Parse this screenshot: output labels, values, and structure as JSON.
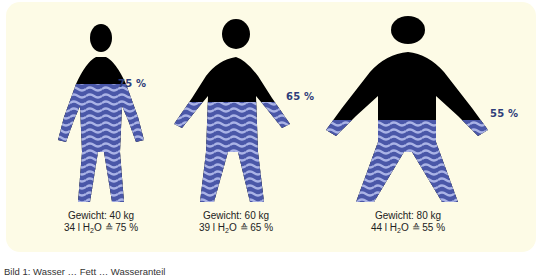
{
  "figures": [
    {
      "id": "person-40kg",
      "water_percent_label": "75 %",
      "weight_label": "Gewicht: 40 kg",
      "water_liters": "34 l",
      "water_equiv": "≙ 75 %",
      "water_fraction": 0.75
    },
    {
      "id": "person-60kg",
      "water_percent_label": "65 %",
      "weight_label": "Gewicht: 60 kg",
      "water_liters": "39 l",
      "water_equiv": "≙ 65 %",
      "water_fraction": 0.65
    },
    {
      "id": "person-80kg",
      "water_percent_label": "55 %",
      "weight_label": "Gewicht: 80 kg",
      "water_liters": "44 l",
      "water_equiv": "≙ 55 %",
      "water_fraction": 0.55
    }
  ],
  "water_symbol": {
    "h": "H",
    "sub": "2",
    "o": "O"
  },
  "colors": {
    "panel_bg": "#fdfbe6",
    "body_dark": "#000000",
    "water_blue": "#4a57a8",
    "water_light": "#aab3e6",
    "percent_text": "#2e3d7a"
  },
  "caption": "Bild 1: Wasser … Fett … Wasseranteil"
}
